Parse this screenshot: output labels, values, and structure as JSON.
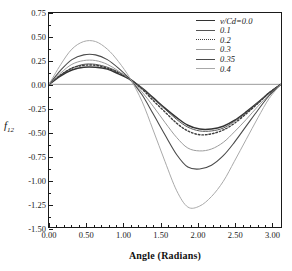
{
  "chart_data": {
    "type": "line",
    "title": "",
    "xlabel": "Angle (Radians)",
    "ylabel": "f12",
    "xlim": [
      0.0,
      3.14159
    ],
    "ylim": [
      -1.5,
      0.75
    ],
    "xticks": [
      "0.00",
      "0.50",
      "1.00",
      "1.50",
      "2.00",
      "2.50",
      "3.00"
    ],
    "xtick_values": [
      0.0,
      0.5,
      1.0,
      1.5,
      2.0,
      2.5,
      3.0
    ],
    "yticks": [
      "0.75",
      "0.50",
      "0.25",
      "0.00",
      "-0.25",
      "-0.50",
      "-0.75",
      "-1.00",
      "-1.25",
      "-1.50"
    ],
    "ytick_values": [
      0.75,
      0.5,
      0.25,
      0.0,
      -0.25,
      -0.5,
      -0.75,
      -1.0,
      -1.25,
      -1.5
    ],
    "grid": false,
    "legend_position": "top-right",
    "legend_title": "v/Cd",
    "series": [
      {
        "name": "v/Cd=0.0",
        "value": 0.0,
        "style": "solid",
        "color": "#333333",
        "width": 1.5,
        "peak": 0.18,
        "peak_x": 0.62,
        "trough": -0.47,
        "trough_x": 1.92,
        "zero_crossing": 1.15,
        "x": [
          0.0,
          0.16,
          0.31,
          0.47,
          0.63,
          0.79,
          0.94,
          1.1,
          1.26,
          1.41,
          1.57,
          1.73,
          1.88,
          2.04,
          2.2,
          2.36,
          2.51,
          2.67,
          2.83,
          2.98,
          3.14
        ],
        "y": [
          0.0,
          0.09,
          0.15,
          0.18,
          0.18,
          0.16,
          0.11,
          0.05,
          -0.04,
          -0.14,
          -0.25,
          -0.35,
          -0.43,
          -0.47,
          -0.47,
          -0.44,
          -0.38,
          -0.29,
          -0.19,
          -0.09,
          0.0
        ]
      },
      {
        "name": "0.1",
        "value": 0.1,
        "style": "solid",
        "color": "#555555",
        "width": 1.0,
        "peak": 0.21,
        "peak_x": 0.62,
        "trough": -0.49,
        "trough_x": 1.93,
        "zero_crossing": 1.16,
        "x": [
          0.0,
          0.16,
          0.31,
          0.47,
          0.63,
          0.79,
          0.94,
          1.1,
          1.26,
          1.41,
          1.57,
          1.73,
          1.88,
          2.04,
          2.2,
          2.36,
          2.51,
          2.67,
          2.83,
          2.98,
          3.14
        ],
        "y": [
          0.0,
          0.1,
          0.17,
          0.21,
          0.21,
          0.18,
          0.13,
          0.06,
          -0.04,
          -0.15,
          -0.26,
          -0.37,
          -0.45,
          -0.49,
          -0.49,
          -0.46,
          -0.39,
          -0.3,
          -0.19,
          -0.09,
          0.0
        ]
      },
      {
        "name": "0.2",
        "value": 0.2,
        "style": "dotted",
        "color": "#3d3d3d",
        "width": 1.4,
        "peak": 0.2,
        "peak_x": 0.6,
        "trough": -0.53,
        "trough_x": 1.9,
        "zero_crossing": 1.14,
        "x": [
          0.0,
          0.16,
          0.31,
          0.47,
          0.63,
          0.79,
          0.94,
          1.1,
          1.26,
          1.41,
          1.57,
          1.73,
          1.88,
          2.04,
          2.2,
          2.36,
          2.51,
          2.67,
          2.83,
          2.98,
          3.14
        ],
        "y": [
          0.0,
          0.1,
          0.17,
          0.2,
          0.2,
          0.17,
          0.12,
          0.05,
          -0.05,
          -0.17,
          -0.29,
          -0.41,
          -0.49,
          -0.53,
          -0.52,
          -0.48,
          -0.41,
          -0.31,
          -0.2,
          -0.09,
          0.0
        ]
      },
      {
        "name": "0.3",
        "value": 0.3,
        "style": "solid",
        "color": "#9b9b9b",
        "width": 1.0,
        "peak": 0.25,
        "peak_x": 0.62,
        "trough": -0.7,
        "trough_x": 1.88,
        "zero_crossing": 1.14,
        "x": [
          0.0,
          0.16,
          0.31,
          0.47,
          0.63,
          0.79,
          0.94,
          1.1,
          1.26,
          1.41,
          1.57,
          1.73,
          1.88,
          2.04,
          2.2,
          2.36,
          2.51,
          2.67,
          2.83,
          2.98,
          3.14
        ],
        "y": [
          0.0,
          0.12,
          0.21,
          0.25,
          0.25,
          0.21,
          0.14,
          0.05,
          -0.08,
          -0.23,
          -0.4,
          -0.56,
          -0.67,
          -0.7,
          -0.68,
          -0.61,
          -0.5,
          -0.37,
          -0.23,
          -0.11,
          0.0
        ]
      },
      {
        "name": "0.35",
        "value": 0.35,
        "style": "solid",
        "color": "#4a4a4a",
        "width": 1.1,
        "peak": 0.31,
        "peak_x": 0.63,
        "trough": -0.89,
        "trough_x": 1.86,
        "zero_crossing": 1.13,
        "x": [
          0.0,
          0.16,
          0.31,
          0.47,
          0.63,
          0.79,
          0.94,
          1.1,
          1.26,
          1.41,
          1.57,
          1.73,
          1.88,
          2.04,
          2.2,
          2.36,
          2.51,
          2.67,
          2.83,
          2.98,
          3.14
        ],
        "y": [
          0.0,
          0.15,
          0.26,
          0.31,
          0.31,
          0.26,
          0.17,
          0.05,
          -0.11,
          -0.31,
          -0.53,
          -0.74,
          -0.87,
          -0.89,
          -0.85,
          -0.75,
          -0.61,
          -0.44,
          -0.27,
          -0.12,
          0.0
        ]
      },
      {
        "name": "0.4",
        "value": 0.4,
        "style": "solid",
        "color": "#a8a8a8",
        "width": 1.0,
        "peak": 0.45,
        "peak_x": 0.64,
        "trough": -1.29,
        "trough_x": 1.82,
        "zero_crossing": 1.12,
        "x": [
          0.0,
          0.16,
          0.31,
          0.47,
          0.63,
          0.79,
          0.94,
          1.1,
          1.26,
          1.41,
          1.57,
          1.73,
          1.88,
          2.04,
          2.2,
          2.36,
          2.51,
          2.67,
          2.83,
          2.98,
          3.14
        ],
        "y": [
          0.0,
          0.21,
          0.37,
          0.45,
          0.45,
          0.37,
          0.24,
          0.06,
          -0.18,
          -0.48,
          -0.81,
          -1.12,
          -1.29,
          -1.28,
          -1.18,
          -1.02,
          -0.81,
          -0.58,
          -0.35,
          -0.15,
          0.0
        ]
      }
    ]
  }
}
